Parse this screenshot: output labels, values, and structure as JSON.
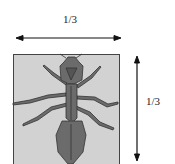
{
  "figure": {
    "top_label": "1/3",
    "side_label": "1/3",
    "square_fill": "#d2d2d2",
    "ant_fill": "#6b6b6b",
    "ant_stroke": "#333333"
  }
}
